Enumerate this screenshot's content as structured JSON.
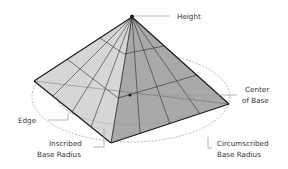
{
  "diagram": {
    "type": "labeled-geometry",
    "labels": {
      "height": "Height",
      "center_line1": "Center",
      "center_line2": "of Base",
      "edge": "Edge",
      "inscribed_line1": "Inscribed",
      "inscribed_line2": "Base Radius",
      "circumscribed_line1": "Circumscribed",
      "circumscribed_line2": "Base Radius"
    },
    "colors": {
      "left_face": "#d6d6d6",
      "right_face": "#a9a9a9",
      "edge_stroke": "#1a1a1a",
      "grid_stroke": "#2b2b2b",
      "circle_stroke": "#8a8a8a",
      "leader_stroke": "#9a9a9a",
      "label_text": "#333333"
    }
  }
}
